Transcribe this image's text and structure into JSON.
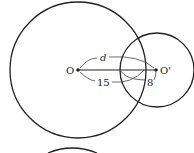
{
  "diagram": {
    "type": "two intersecting circles",
    "labels": {
      "center_left": "O",
      "center_right": "O'",
      "distance": "d",
      "radius_left": "15",
      "radius_right": "8"
    },
    "circles": [
      {
        "name": "large-circle",
        "cx": 78,
        "cy": 70,
        "r": 68
      },
      {
        "name": "small-circle",
        "cx": 157,
        "cy": 70,
        "r": 37
      }
    ],
    "stroke_color": "#222222"
  }
}
